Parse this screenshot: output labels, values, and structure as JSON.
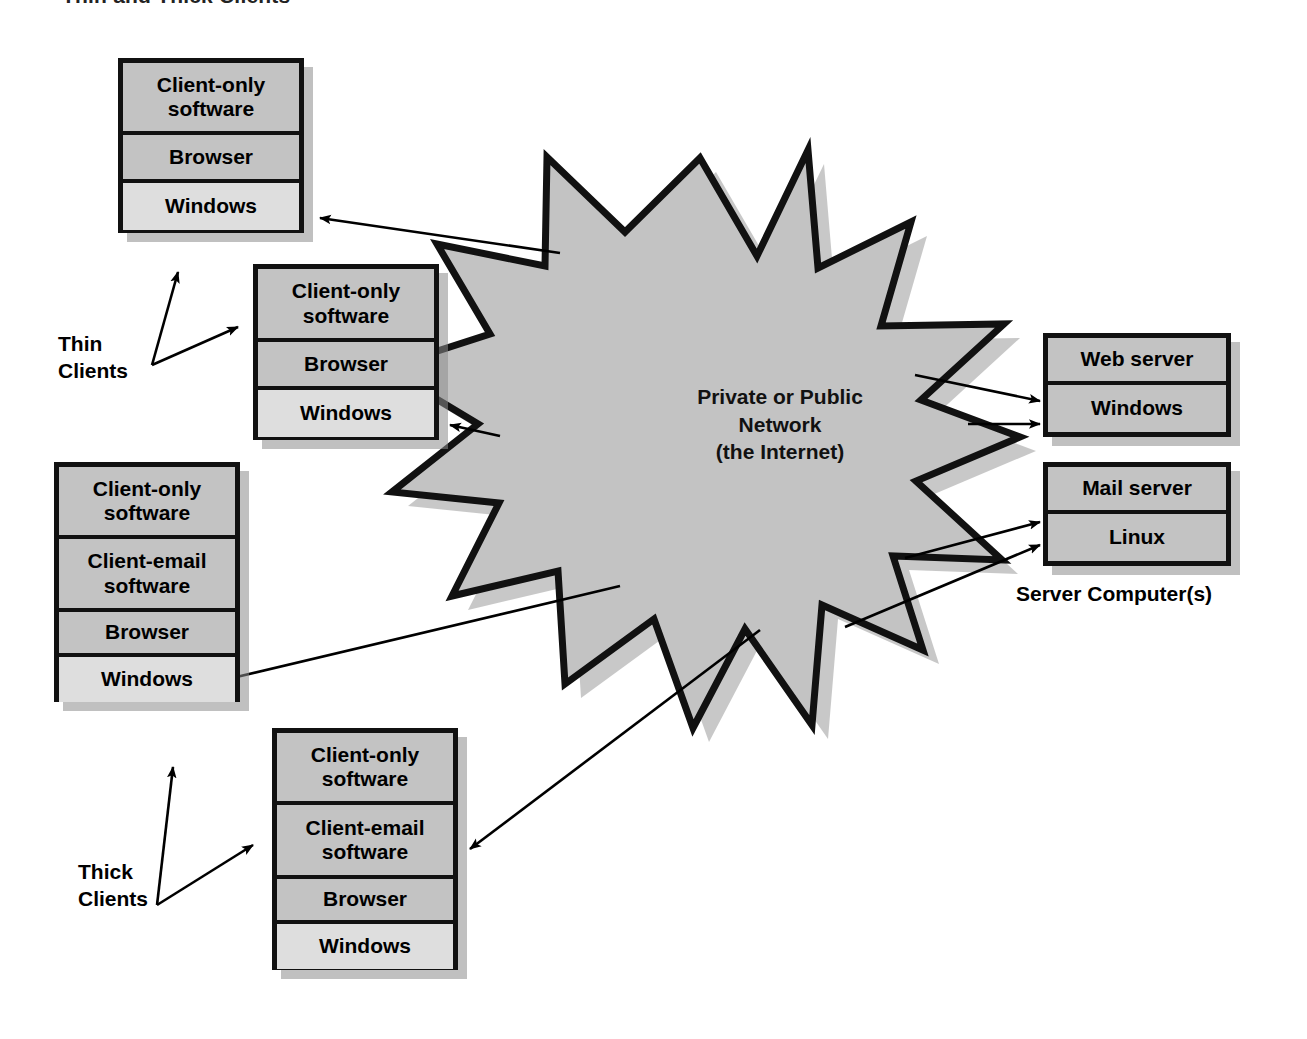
{
  "figure": {
    "title": "Thin and Thick Clients"
  },
  "network": {
    "shape": "starburst-12-point",
    "fill_color": "#c3c3c3",
    "stroke_color": "#111111",
    "line1": "Private or Public",
    "line2": "Network",
    "line3": "(the Internet)"
  },
  "groups": {
    "thin": {
      "line1": "Thin",
      "line2": "Clients"
    },
    "thick": {
      "line1": "Thick",
      "line2": "Clients"
    },
    "servers": {
      "label": "Server Computer(s)"
    }
  },
  "clients": [
    {
      "id": "thin-client-1",
      "kind": "thin",
      "rows": [
        {
          "label": "Client-only software",
          "shade": "gray"
        },
        {
          "label": "Browser",
          "shade": "gray"
        },
        {
          "label": "Windows",
          "shade": "light"
        }
      ]
    },
    {
      "id": "thin-client-2",
      "kind": "thin",
      "rows": [
        {
          "label": "Client-only software",
          "shade": "gray"
        },
        {
          "label": "Browser",
          "shade": "gray"
        },
        {
          "label": "Windows",
          "shade": "light"
        }
      ]
    },
    {
      "id": "thick-client-1",
      "kind": "thick",
      "rows": [
        {
          "label": "Client-only software",
          "shade": "gray"
        },
        {
          "label": "Client-email software",
          "shade": "gray"
        },
        {
          "label": "Browser",
          "shade": "gray"
        },
        {
          "label": "Windows",
          "shade": "light"
        }
      ]
    },
    {
      "id": "thick-client-2",
      "kind": "thick",
      "rows": [
        {
          "label": "Client-only software",
          "shade": "gray"
        },
        {
          "label": "Client-email software",
          "shade": "gray"
        },
        {
          "label": "Browser",
          "shade": "gray"
        },
        {
          "label": "Windows",
          "shade": "light"
        }
      ]
    }
  ],
  "servers": [
    {
      "id": "web-server",
      "rows": [
        {
          "label": "Web server",
          "shade": "gray"
        },
        {
          "label": "Windows",
          "shade": "gray"
        }
      ]
    },
    {
      "id": "mail-server",
      "rows": [
        {
          "label": "Mail server",
          "shade": "gray"
        },
        {
          "label": "Linux",
          "shade": "gray"
        }
      ]
    }
  ],
  "colors": {
    "box_fill": "#c3c3c3",
    "box_fill_light": "#dedede",
    "stroke": "#111111",
    "shadow": "#8c8c8c",
    "background": "#ffffff"
  }
}
